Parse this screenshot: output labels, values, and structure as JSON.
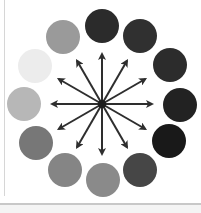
{
  "diagram": {
    "type": "radial-color-wheel",
    "center": {
      "x": 102,
      "y": 104
    },
    "circle_radius": 17,
    "circles": [
      {
        "position": "12-oclock",
        "x": 102,
        "y": 26,
        "color": "#2b2b2b"
      },
      {
        "position": "1-oclock",
        "x": 140,
        "y": 36,
        "color": "#303030"
      },
      {
        "position": "2-oclock",
        "x": 170,
        "y": 65,
        "color": "#2c2c2c"
      },
      {
        "position": "3-oclock",
        "x": 180,
        "y": 105,
        "color": "#222222"
      },
      {
        "position": "4-oclock",
        "x": 169,
        "y": 141,
        "color": "#191919"
      },
      {
        "position": "5-oclock",
        "x": 140,
        "y": 170,
        "color": "#464646"
      },
      {
        "position": "6-oclock",
        "x": 103,
        "y": 180,
        "color": "#8a8a8a"
      },
      {
        "position": "7-oclock",
        "x": 65,
        "y": 170,
        "color": "#858585"
      },
      {
        "position": "8-oclock",
        "x": 36,
        "y": 143,
        "color": "#777777"
      },
      {
        "position": "9-oclock",
        "x": 24,
        "y": 104,
        "color": "#b7b7b7"
      },
      {
        "position": "10-oclock",
        "x": 35,
        "y": 66,
        "color": "#ececec"
      },
      {
        "position": "11-oclock",
        "x": 63,
        "y": 37,
        "color": "#9a9a9a"
      }
    ],
    "arrows": {
      "count": 12,
      "length": 50,
      "color": "#2e2e2e",
      "angles_deg": [
        0,
        30,
        60,
        90,
        120,
        150,
        180,
        210,
        240,
        270,
        300,
        330
      ]
    },
    "hub_color": "#1e1e1e"
  }
}
